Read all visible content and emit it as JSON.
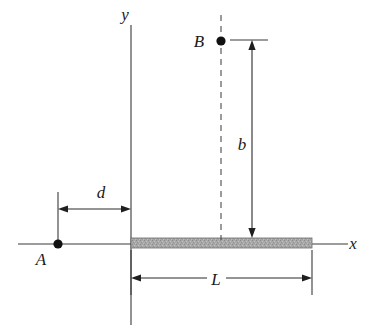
{
  "figure": {
    "background_color": "#ffffff",
    "line_color": "#3a3a3a",
    "beam_fill_color": "#a6a6a6",
    "dot_color": "#111111",
    "width": 373,
    "height": 335
  },
  "axes": {
    "x_label": "x",
    "y_label": "y",
    "origin_x": 131,
    "origin_y": 244
  },
  "points": [
    {
      "id": "point-a",
      "label": "A",
      "cx": 58,
      "cy": 244,
      "radius": 4.6,
      "label_x": 41,
      "label_y": 265
    },
    {
      "id": "point-b",
      "label": "B",
      "cx": 221,
      "cy": 41,
      "radius": 4.6,
      "label_x": 196,
      "label_y": 47
    }
  ],
  "beam": {
    "name": "beam",
    "x": 131,
    "y": 238,
    "width": 181,
    "height": 10,
    "fill": "#a6a6a6",
    "texture": "stippled-gray"
  },
  "dimensions": [
    {
      "id": "dimension-d",
      "label": "d",
      "orientation": "horizontal",
      "from": 58,
      "to": 131,
      "axis_pos": 209,
      "label_x": 101,
      "label_y": 198,
      "arrows": "both"
    },
    {
      "id": "dimension-b",
      "label": "b",
      "orientation": "vertical",
      "from": 40,
      "to": 238,
      "axis_pos": 252,
      "label_x": 238,
      "label_y": 150,
      "arrows": "both"
    },
    {
      "id": "dimension-l",
      "label": "L",
      "orientation": "horizontal",
      "from": 131,
      "to": 312,
      "axis_pos": 278,
      "label_x": 216,
      "label_y": 285,
      "arrows": "both"
    }
  ],
  "guides": {
    "dashed_vertical_through_b": {
      "x": 221,
      "y_top": 15,
      "y_bottom": 240
    },
    "extension_a": {
      "x": 58,
      "y_top": 192,
      "y_bottom": 246
    },
    "extension_b_horizontal": {
      "y": 40,
      "x_left": 230,
      "x_right": 268
    },
    "extension_l_left": {
      "x": 131,
      "y_top": 250,
      "y_bottom": 295
    },
    "extension_l_right": {
      "x": 312,
      "y_top": 250,
      "y_bottom": 295
    }
  }
}
